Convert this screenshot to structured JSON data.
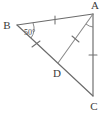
{
  "figure": {
    "type": "geometry-diagram",
    "shape": "triangle-with-cevian",
    "stroke_color": "#6b6b6b",
    "label_color": "#3a3a3a",
    "background": "#ffffff",
    "width": 108,
    "height": 113
  },
  "vertices": [
    {
      "id": "A",
      "label": "A",
      "x": 93,
      "y": 14,
      "label_x": 95,
      "label_y": 8
    },
    {
      "id": "B",
      "label": "B",
      "x": 17,
      "y": 25,
      "label_x": 7,
      "label_y": 27
    },
    {
      "id": "C",
      "label": "C",
      "x": 93,
      "y": 96,
      "label_x": 94,
      "label_y": 108
    },
    {
      "id": "D",
      "label": "D",
      "x": 58,
      "y": 63,
      "label_x": 56,
      "label_y": 75
    }
  ],
  "segments": [
    {
      "id": "BA",
      "from": "B",
      "to": "A",
      "ticks": 1
    },
    {
      "id": "AC",
      "from": "A",
      "to": "C",
      "ticks": 1
    },
    {
      "id": "BC",
      "from": "B",
      "to": "C",
      "ticks": 0
    },
    {
      "id": "BD",
      "from": "B",
      "to": "D",
      "ticks": 1
    },
    {
      "id": "AD",
      "from": "A",
      "to": "D",
      "ticks": 1
    }
  ],
  "angles": [
    {
      "id": "angle-B",
      "at": "B",
      "label": "50°",
      "label_x": 24,
      "label_y": 34
    },
    {
      "id": "angle-A",
      "at": "A",
      "label": "",
      "marked": true
    }
  ]
}
